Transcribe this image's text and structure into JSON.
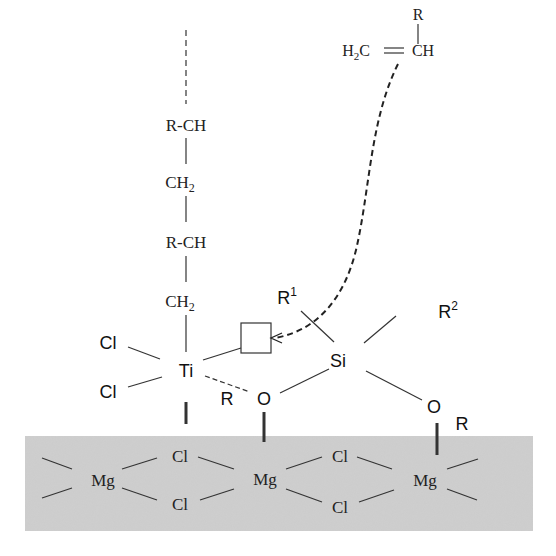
{
  "diagram": {
    "type": "Ziegler-Natta catalyst active site on MgCl2 support",
    "support": {
      "color": "#cfcfcf",
      "mg_labels": [
        "Mg",
        "Mg",
        "Mg"
      ],
      "cl_labels": [
        "Cl",
        "Cl",
        "Cl",
        "Cl"
      ]
    },
    "polymer_chain": {
      "units": [
        "R-CH",
        "CH",
        "2",
        "R-CH",
        "CH",
        "2"
      ],
      "unit1": "R-CH",
      "unit2_main": "CH",
      "unit2_sub": "2",
      "unit3": "R-CH",
      "unit4_main": "CH",
      "unit4_sub": "2"
    },
    "titanium_center": {
      "ti_label": "Ti",
      "cl_top": "Cl",
      "cl_bottom": "Cl",
      "r_label": "R",
      "vacant_site": "empty coordination site (square)"
    },
    "silane_donor": {
      "si_label": "Si",
      "r1_main": "R",
      "r1_sup": "1",
      "r2_main": "R",
      "r2_sup": "2",
      "o_left": "O",
      "o_right": "O",
      "r_right": "R"
    },
    "monomer": {
      "r_label": "R",
      "h2c_main": "H",
      "h2c_sub": "2",
      "h2c_c": "C",
      "ch_label": "CH",
      "double_bond": "="
    },
    "arrow": "dashed curved arrow from monomer to vacant Ti site"
  }
}
